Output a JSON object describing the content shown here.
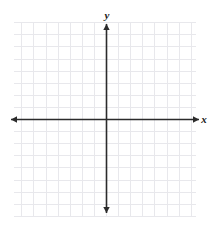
{
  "figure": {
    "kind": "coordinate-plane",
    "width": 213,
    "height": 227,
    "background_color": "#ffffff"
  },
  "chart_data": {
    "type": "scatter",
    "title": "",
    "subtitle": "",
    "xlabel": "x",
    "ylabel": "y",
    "x": [],
    "y": [],
    "series": [],
    "annotations": [],
    "xlim": [
      -8,
      8
    ],
    "ylim": [
      -8,
      8
    ],
    "xticks": [
      -8,
      -7,
      -6,
      -5,
      -4,
      -3,
      -2,
      -1,
      0,
      1,
      2,
      3,
      4,
      5,
      6,
      7,
      8
    ],
    "yticks": [
      -8,
      -7,
      -6,
      -5,
      -4,
      -3,
      -2,
      -1,
      0,
      1,
      2,
      3,
      4,
      5,
      6,
      7,
      8
    ],
    "xticklabels": [],
    "yticklabels": [],
    "grid": true,
    "grid_color": "#e8e8ec",
    "grid_spacing_px": 12.1,
    "legend": null,
    "legend_position": "none",
    "axis_color": "#2b2b2b",
    "axis_arrows": [
      "left",
      "right",
      "up",
      "down"
    ],
    "origin_px": {
      "x": 106,
      "y": 119
    }
  },
  "labels": {
    "y_axis": "y",
    "x_axis": "x"
  },
  "grid_geometry": {
    "left_px": 14,
    "right_px": 196,
    "top_px": 22,
    "bottom_px": 216,
    "columns": 15,
    "rows": 16
  },
  "axes_geometry": {
    "x_axis_start_px": 11,
    "x_axis_end_px": 199,
    "y_axis_top_px": 24,
    "y_axis_bottom_px": 213
  }
}
